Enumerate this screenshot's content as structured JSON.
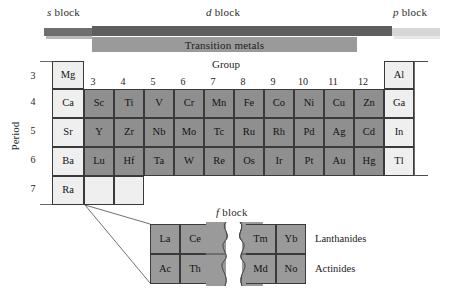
{
  "diagram": {
    "group_axis_label": "Group",
    "period_axis_label": "Period"
  },
  "blocks": [
    {
      "id": "s",
      "prefix": "s",
      "label": " block"
    },
    {
      "id": "d",
      "prefix": "d",
      "label": " block"
    },
    {
      "id": "p",
      "prefix": "p",
      "label": " block"
    },
    {
      "id": "f",
      "prefix": "f",
      "label": " block"
    }
  ],
  "bars": {
    "transition_metals_label": "Transition metals",
    "s_color": "#6f6f6f",
    "d_color": "#5e5e5e",
    "p_color": "#d6d6d6",
    "tm_color": "#9a9a9a"
  },
  "group_numbers": [
    "3",
    "4",
    "5",
    "6",
    "7",
    "8",
    "9",
    "10",
    "11",
    "12"
  ],
  "period_numbers": [
    "3",
    "4",
    "5",
    "6",
    "7"
  ],
  "main_table": {
    "s_column": [
      "Mg",
      "Ca",
      "Sr",
      "Ba",
      "Ra"
    ],
    "p_column": [
      "Al",
      "Ga",
      "In",
      "Tl"
    ],
    "d_rows": [
      [],
      [
        "Sc",
        "Ti",
        "V",
        "Cr",
        "Mn",
        "Fe",
        "Co",
        "Ni",
        "Cu",
        "Zn"
      ],
      [
        "Y",
        "Zr",
        "Nb",
        "Mo",
        "Tc",
        "Ru",
        "Rh",
        "Pd",
        "Ag",
        "Cd"
      ],
      [
        "Lu",
        "Hf",
        "Ta",
        "W",
        "Re",
        "Os",
        "Ir",
        "Pt",
        "Au",
        "Hg"
      ],
      [
        "",
        ""
      ]
    ]
  },
  "f_block": {
    "rows": [
      {
        "label": "Lanthanides",
        "left": [
          "La",
          "Ce"
        ],
        "right": [
          "Tm",
          "Yb"
        ]
      },
      {
        "label": "Actinides",
        "left": [
          "Ac",
          "Th"
        ],
        "right": [
          "Md",
          "No"
        ]
      }
    ]
  },
  "colors": {
    "d_cell": "#8f8f8f",
    "s_cell": "#efefef",
    "p_cell": "#efefef",
    "f_cell": "#9a9a9a",
    "border": "#3a3a3a"
  }
}
